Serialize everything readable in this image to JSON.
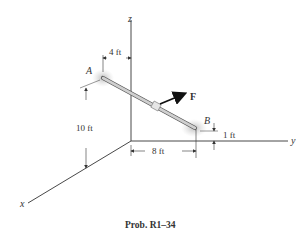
{
  "figure": {
    "caption": "Prob. R1–34",
    "axes": {
      "x": "x",
      "y": "y",
      "z": "z"
    },
    "points": {
      "A": "A",
      "B": "B"
    },
    "force": "F",
    "dimensions": {
      "horizontal_offset_A": "4 ft",
      "height_A": "10 ft",
      "y_distance_B": "8 ft",
      "height_B": "1 ft"
    },
    "colors": {
      "lines": "#333333",
      "rod": "#b8b8b8",
      "support_shadow": "#c8c8c8"
    }
  }
}
